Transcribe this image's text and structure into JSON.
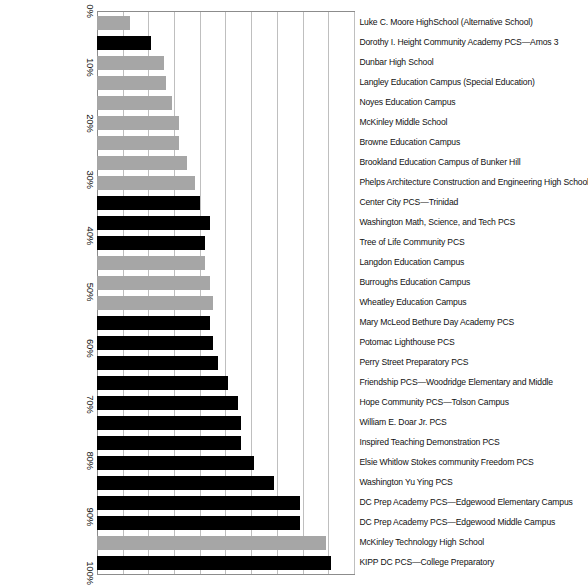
{
  "chart_data": {
    "type": "bar",
    "title": "",
    "subtitle": "",
    "xlabel": "",
    "ylabel": "",
    "orientation": "vertical-rotated-90",
    "grid": true,
    "legend": false,
    "ylim": [
      0,
      100
    ],
    "value_suffix": "%",
    "tick_labels": [
      "0%",
      "10%",
      "20%",
      "30%",
      "40%",
      "50%",
      "60%",
      "70%",
      "80%",
      "90%",
      "100%"
    ],
    "tick_values": [
      0,
      10,
      20,
      30,
      40,
      50,
      60,
      70,
      80,
      90,
      100
    ],
    "colors": {
      "series_a": "#a6a6a6",
      "series_b": "#000000",
      "gridline": "#bfbfbf",
      "axis": "#8c8c8c",
      "background": "#ffffff"
    },
    "categories": [
      "Luke C. Moore HighSchool (Alternative School)",
      "Dorothy I. Height Community Academy PCS—Amos 3",
      "Dunbar High School",
      "Langley Education Campus (Special Education)",
      "Noyes Education Campus",
      "McKinley Middle School",
      "Browne Education Campus",
      "Brookland Education Campus of Bunker Hill",
      "Phelps Architecture Construction and Engineering High School",
      "Center City PCS—Trinidad",
      "Washington Math, Science, and Tech PCS",
      "Tree of Life Community PCS",
      "Langdon Education Campus",
      "Burroughs Education Campus",
      "Wheatley Education Campus",
      "Mary McLeod Bethure Day Academy PCS",
      "Potomac Lighthouse PCS",
      "Perry Street Preparatory PCS",
      "Friendship PCS—Woodridge Elementary and Middle",
      "Hope Community PCS—Tolson Campus",
      "William E. Doar Jr. PCS",
      "Inspired Teaching Demonstration PCS",
      "Elsie Whitlow Stokes community Freedom PCS",
      "Washington Yu Ying PCS",
      "DC Prep Academy PCS—Edgewood Elementary Campus",
      "DC Prep Academy PCS—Edgewood Middle Campus",
      "McKinley Technology High School",
      "KIPP DC PCS—College Preparatory"
    ],
    "values": [
      13,
      21,
      26,
      27,
      29,
      32,
      32,
      35,
      38,
      40,
      44,
      42,
      42,
      44,
      45,
      44,
      45,
      47,
      51,
      55,
      56,
      56,
      61,
      69,
      79,
      79,
      89,
      91
    ],
    "bar_colors": [
      "#a6a6a6",
      "#000000",
      "#a6a6a6",
      "#a6a6a6",
      "#a6a6a6",
      "#a6a6a6",
      "#a6a6a6",
      "#a6a6a6",
      "#a6a6a6",
      "#000000",
      "#000000",
      "#000000",
      "#a6a6a6",
      "#a6a6a6",
      "#a6a6a6",
      "#000000",
      "#000000",
      "#000000",
      "#000000",
      "#000000",
      "#000000",
      "#000000",
      "#000000",
      "#000000",
      "#000000",
      "#000000",
      "#a6a6a6",
      "#000000"
    ]
  }
}
